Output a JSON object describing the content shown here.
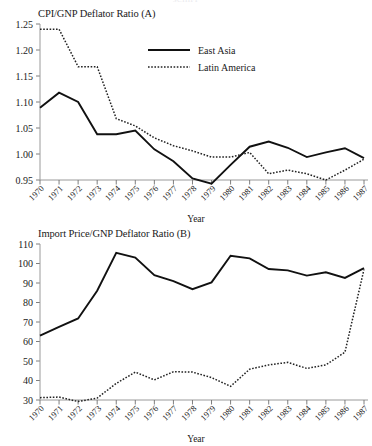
{
  "page": {
    "cut_off_header": "SCHIFF",
    "axis_x_label": "Year"
  },
  "legend": {
    "east_asia": "East Asia",
    "latin_america": "Latin America"
  },
  "chart_data": [
    {
      "id": "panel-a",
      "type": "line",
      "title": "CPI/GNP Deflator Ratio (A)",
      "xlabel": "Year",
      "ylabel": "",
      "grid": false,
      "legend_position": "top-center",
      "x": [
        1970,
        1971,
        1972,
        1973,
        1974,
        1975,
        1976,
        1977,
        1978,
        1979,
        1980,
        1981,
        1982,
        1983,
        1984,
        1985,
        1986,
        1987
      ],
      "xticklabels": [
        "1970",
        "1971",
        "1972",
        "1973",
        "1974",
        "1975",
        "1976",
        "1977",
        "1978",
        "1979",
        "1980",
        "1981",
        "1982",
        "1983",
        "1984",
        "1985",
        "1986",
        "1987"
      ],
      "ylim": [
        0.95,
        1.25
      ],
      "yticks": [
        0.95,
        1.0,
        1.05,
        1.1,
        1.15,
        1.2,
        1.25
      ],
      "yticklabels": [
        "0.95",
        "1.00",
        "1.05",
        "1.10",
        "1.15",
        "1.20",
        "1.25"
      ],
      "series": [
        {
          "name": "East Asia",
          "style": "solid",
          "values": [
            1.089,
            1.118,
            1.1,
            1.038,
            1.038,
            1.045,
            1.009,
            0.986,
            0.953,
            0.943,
            0.979,
            1.014,
            1.024,
            1.012,
            0.994,
            1.003,
            1.011,
            0.992
          ]
        },
        {
          "name": "Latin America",
          "style": "dotted",
          "values": [
            1.24,
            1.24,
            1.168,
            1.168,
            1.068,
            1.054,
            1.031,
            1.016,
            1.006,
            0.994,
            0.994,
            1.003,
            0.962,
            0.969,
            0.962,
            0.95,
            0.969,
            0.99
          ]
        }
      ]
    },
    {
      "id": "panel-b",
      "type": "line",
      "title": "Import Price/GNP Deflator Ratio (B)",
      "xlabel": "Year",
      "ylabel": "",
      "grid": false,
      "legend_position": "none",
      "x": [
        1970,
        1971,
        1972,
        1973,
        1974,
        1975,
        1976,
        1977,
        1978,
        1979,
        1980,
        1981,
        1982,
        1983,
        1984,
        1985,
        1986,
        1987
      ],
      "xticklabels": [
        "1970",
        "1971",
        "1972",
        "1973",
        "1974",
        "1975",
        "1976",
        "1977",
        "1978",
        "1979",
        "1980",
        "1981",
        "1982",
        "1983",
        "1984",
        "1985",
        "1986",
        "1987"
      ],
      "ylim": [
        30,
        110
      ],
      "yticks": [
        30,
        40,
        50,
        60,
        70,
        80,
        90,
        100,
        110
      ],
      "yticklabels": [
        "30",
        "40",
        "50",
        "60",
        "70",
        "80",
        "90",
        "100",
        "110"
      ],
      "series": [
        {
          "name": "East Asia",
          "style": "solid",
          "values": [
            63.0,
            67.5,
            71.8,
            86.0,
            105.5,
            103.0,
            94.0,
            91.0,
            86.8,
            90.3,
            104.0,
            102.6,
            97.2,
            96.5,
            93.8,
            95.5,
            92.6,
            97.6
          ]
        },
        {
          "name": "Latin America",
          "style": "dotted",
          "values": [
            31.2,
            31.5,
            29.2,
            31.0,
            38.5,
            44.3,
            40.3,
            44.5,
            44.3,
            41.5,
            37.0,
            45.8,
            48.0,
            49.3,
            46.2,
            48.0,
            54.5,
            97.0
          ]
        }
      ]
    }
  ]
}
